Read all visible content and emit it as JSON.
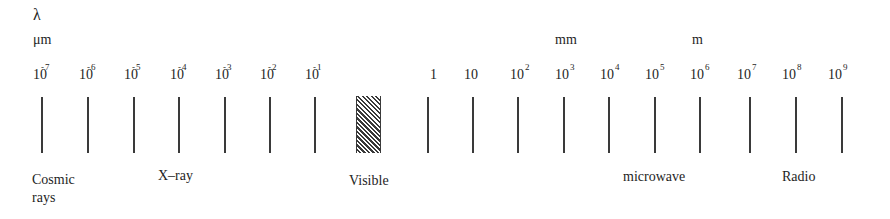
{
  "axis": {
    "symbol": "λ",
    "units": [
      {
        "label": "μm",
        "left": 33,
        "top": 33
      },
      {
        "label": "mm",
        "left": 555,
        "top": 33
      },
      {
        "label": "m",
        "left": 692,
        "top": 33
      }
    ]
  },
  "ticks": [
    {
      "base": "10",
      "exp": "-7",
      "neg": true,
      "label_left": 33,
      "tick_x": 41
    },
    {
      "base": "10",
      "exp": "-6",
      "neg": true,
      "label_left": 79,
      "tick_x": 87
    },
    {
      "base": "10",
      "exp": "-5",
      "neg": true,
      "label_left": 124,
      "tick_x": 133
    },
    {
      "base": "10",
      "exp": "-4",
      "neg": true,
      "label_left": 170,
      "tick_x": 178
    },
    {
      "base": "10",
      "exp": "-3",
      "neg": true,
      "label_left": 215,
      "tick_x": 224
    },
    {
      "base": "10",
      "exp": "-2",
      "neg": true,
      "label_left": 260,
      "tick_x": 269
    },
    {
      "base": "10",
      "exp": "-1",
      "neg": true,
      "label_left": 305,
      "tick_x": 314
    },
    {
      "base": "1",
      "exp": "",
      "neg": false,
      "label_left": 430,
      "tick_x": 427
    },
    {
      "base": "10",
      "exp": "",
      "neg": false,
      "label_left": 464,
      "tick_x": 472
    },
    {
      "base": "10",
      "exp": "2",
      "neg": false,
      "label_left": 510,
      "tick_x": 517
    },
    {
      "base": "10",
      "exp": "3",
      "neg": false,
      "label_left": 555,
      "tick_x": 563
    },
    {
      "base": "10",
      "exp": "4",
      "neg": false,
      "label_left": 600,
      "tick_x": 608
    },
    {
      "base": "10",
      "exp": "5",
      "neg": false,
      "label_left": 645,
      "tick_x": 654
    },
    {
      "base": "10",
      "exp": "6",
      "neg": false,
      "label_left": 690,
      "tick_x": 699
    },
    {
      "base": "10",
      "exp": "7",
      "neg": false,
      "label_left": 737,
      "tick_x": 749
    },
    {
      "base": "10",
      "exp": "8",
      "neg": false,
      "label_left": 782,
      "tick_x": 795
    },
    {
      "base": "10",
      "exp": "9",
      "neg": false,
      "label_left": 828,
      "tick_x": 841
    }
  ],
  "visible_band": {
    "left": 356,
    "width": 25,
    "pattern": "diagonal-hatch"
  },
  "regions": [
    {
      "label": "Cosmic\nrays",
      "lines": [
        "Cosmic",
        "rays"
      ],
      "left": 32,
      "top": 171
    },
    {
      "label": "X-ray",
      "lines": [
        "X–ray"
      ],
      "left": 158,
      "top": 167
    },
    {
      "label": "Visible",
      "lines": [
        "Visible"
      ],
      "left": 349,
      "top": 172
    },
    {
      "label": "microwave",
      "lines": [
        "microwave"
      ],
      "left": 623,
      "top": 168
    },
    {
      "label": "Radio",
      "lines": [
        "Radio"
      ],
      "left": 782,
      "top": 168
    }
  ],
  "colors": {
    "ink": "#1e1e1e",
    "line": "#3a3a3a",
    "background": "#ffffff"
  }
}
